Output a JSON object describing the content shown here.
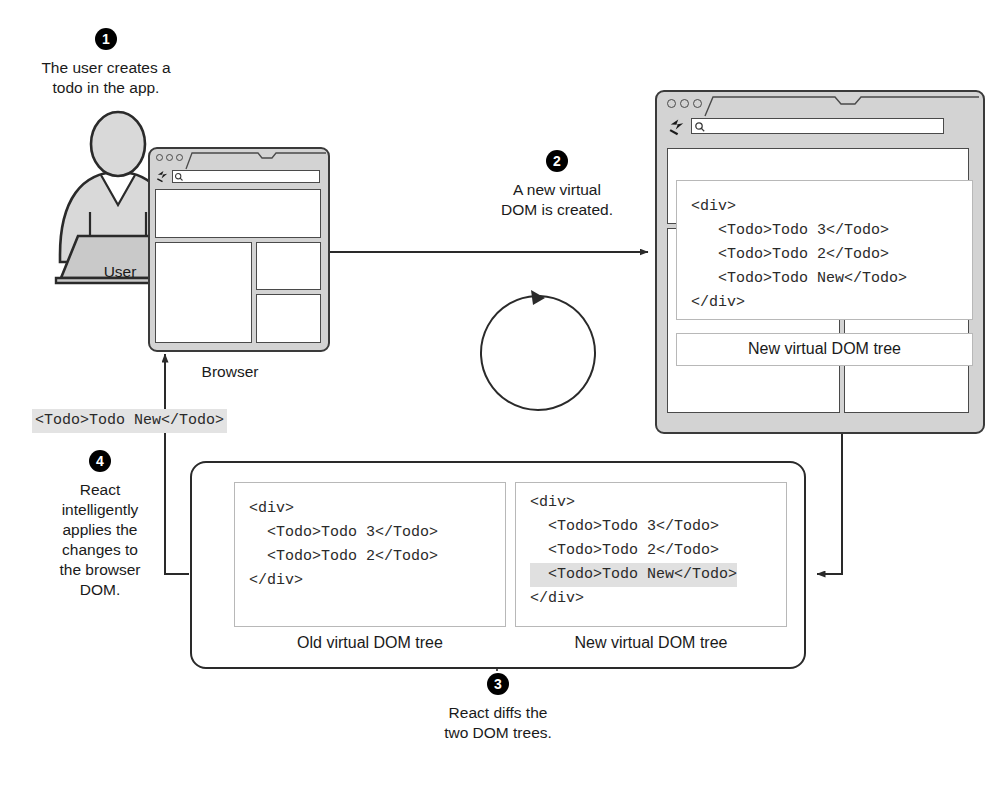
{
  "steps": [
    {
      "number": "1",
      "text": "The user creates a\ntodo in the app."
    },
    {
      "number": "2",
      "text": "A new virtual\nDOM is created."
    },
    {
      "number": "3",
      "text": "React diffs the\ntwo DOM trees."
    },
    {
      "number": "4",
      "text": "React\nintelligently\napplies the\nchanges to\nthe browser\nDOM."
    }
  ],
  "actor": {
    "label": "User",
    "icon": "person-at-laptop-icon"
  },
  "browser_step1": {
    "label": "Browser",
    "icon": "browser-window-icon",
    "reload_icon": "reload-icon",
    "search_icon": "search-icon",
    "url_value": ""
  },
  "browser_step2": {
    "icon": "browser-window-icon",
    "reload_icon": "reload-icon",
    "search_icon": "search-icon",
    "url_value": "",
    "code": "<div>\n   <Todo>Todo 3</Todo>\n   <Todo>Todo 2</Todo>\n   <Todo>Todo New</Todo>\n</div>",
    "tree_caption": "New virtual DOM tree"
  },
  "diff_panel": {
    "old_tree": {
      "caption": "Old virtual DOM tree",
      "lines": [
        {
          "text": "<div>",
          "highlighted": false
        },
        {
          "text": "  <Todo>Todo 3</Todo>",
          "highlighted": false
        },
        {
          "text": "  <Todo>Todo 2</Todo>",
          "highlighted": false
        },
        {
          "text": "</div>",
          "highlighted": false
        }
      ]
    },
    "new_tree": {
      "caption": "New virtual DOM tree",
      "lines": [
        {
          "text": "<div>",
          "highlighted": false
        },
        {
          "text": "  <Todo>Todo 3</Todo>",
          "highlighted": false
        },
        {
          "text": "  <Todo>Todo 2</Todo>",
          "highlighted": false
        },
        {
          "text": "  <Todo>Todo New</Todo>",
          "highlighted": true
        },
        {
          "text": "</div>",
          "highlighted": false
        }
      ]
    }
  },
  "patch_snippet": {
    "text": "<Todo>Todo New</Todo>",
    "highlighted": true
  },
  "colors": {
    "stroke": "#3a3a3a",
    "chrome_fill": "#d3d3d3",
    "figure_fill": "#d8d8d8",
    "highlight": "#e3e3e3",
    "panel_border": "#b8b8b8",
    "badge_bg": "#000000",
    "badge_fg": "#ffffff"
  }
}
